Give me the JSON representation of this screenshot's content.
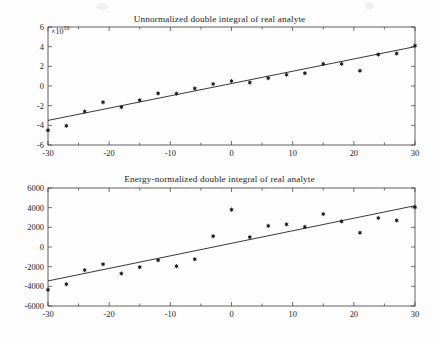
{
  "page": {
    "background": "#fdfdfd",
    "width": 439,
    "height": 345
  },
  "charts": [
    {
      "id": "top",
      "title": "Unnormalized double integral of real analyte",
      "exponent_label": "×10",
      "exponent_sup": "10"
    },
    {
      "id": "bottom",
      "title": "Energy-normalized double integral of real analyte",
      "exponent_label": "",
      "exponent_sup": ""
    }
  ],
  "chart_data": [
    {
      "type": "scatter",
      "title": "Unnormalized double integral of real analyte",
      "subtitle": "",
      "xlabel": "",
      "ylabel": "",
      "y_axis_exponent": "×10^10",
      "xlim": [
        -30,
        30
      ],
      "ylim": [
        -6,
        6
      ],
      "xticks": [
        -30,
        -20,
        -10,
        0,
        10,
        20,
        30
      ],
      "yticks": [
        6,
        4,
        2,
        0,
        -2,
        -4,
        -6
      ],
      "xtick_labels": [
        "-30",
        "-20",
        "-10",
        "0",
        "10",
        "20",
        "30"
      ],
      "ytick_labels": [
        "6",
        "4",
        "2",
        "0",
        "-2",
        "-4",
        "-6"
      ],
      "grid": false,
      "legend": false,
      "minor_xticks": [
        -25,
        -15,
        -5,
        5,
        15,
        25
      ],
      "series": [
        {
          "name": "real analyte double integral",
          "marker": "asterisk",
          "color": "#1a1a1a",
          "x": [
            -30,
            -27,
            -24,
            -21,
            -18,
            -15,
            -12,
            -9,
            -6,
            -3,
            0,
            3,
            6,
            9,
            12,
            15,
            18,
            21,
            24,
            27,
            30
          ],
          "y": [
            -4.5,
            -4.05,
            -2.6,
            -1.65,
            -2.15,
            -1.45,
            -0.75,
            -0.78,
            -0.25,
            0.2,
            0.5,
            0.35,
            0.8,
            1.15,
            1.3,
            2.25,
            2.25,
            1.55,
            3.2,
            3.3,
            4.1
          ]
        }
      ],
      "fit_line": {
        "name": "linear fit",
        "color": "#242424",
        "x": [
          -30,
          30
        ],
        "y": [
          -3.5,
          4.0
        ],
        "slope": 0.125,
        "intercept": 0.25
      }
    },
    {
      "type": "scatter",
      "title": "Energy-normalized double integral of real analyte",
      "subtitle": "",
      "xlabel": "",
      "ylabel": "",
      "y_axis_exponent": "",
      "xlim": [
        -30,
        30
      ],
      "ylim": [
        -6000,
        6000
      ],
      "xticks": [
        -30,
        -20,
        -10,
        0,
        10,
        20,
        30
      ],
      "yticks": [
        6000,
        4000,
        2000,
        0,
        -2000,
        -4000,
        -6000
      ],
      "xtick_labels": [
        "-30",
        "-20",
        "-10",
        "0",
        "10",
        "20",
        "30"
      ],
      "ytick_labels": [
        "6000",
        "4000",
        "2000",
        "0",
        "-2000",
        "-4000",
        "-6000"
      ],
      "grid": false,
      "legend": false,
      "minor_xticks": [
        -25,
        -15,
        -5,
        5,
        15,
        25
      ],
      "series": [
        {
          "name": "energy-normalized double integral",
          "marker": "asterisk",
          "color": "#1a1a1a",
          "x": [
            -30,
            -27,
            -24,
            -21,
            -18,
            -15,
            -12,
            -9,
            -6,
            -3,
            0,
            3,
            6,
            9,
            12,
            15,
            18,
            21,
            24,
            27,
            30
          ],
          "y": [
            -4350,
            -3780,
            -2350,
            -1750,
            -2700,
            -2050,
            -1350,
            -1950,
            -1250,
            1100,
            3800,
            1000,
            2150,
            2300,
            2050,
            3350,
            2600,
            1450,
            2950,
            2700,
            4050
          ]
        }
      ],
      "fit_line": {
        "name": "linear fit",
        "color": "#242424",
        "x": [
          -30,
          30
        ],
        "y": [
          -3450,
          4200
        ],
        "slope": 127.5,
        "intercept": 375
      }
    }
  ]
}
